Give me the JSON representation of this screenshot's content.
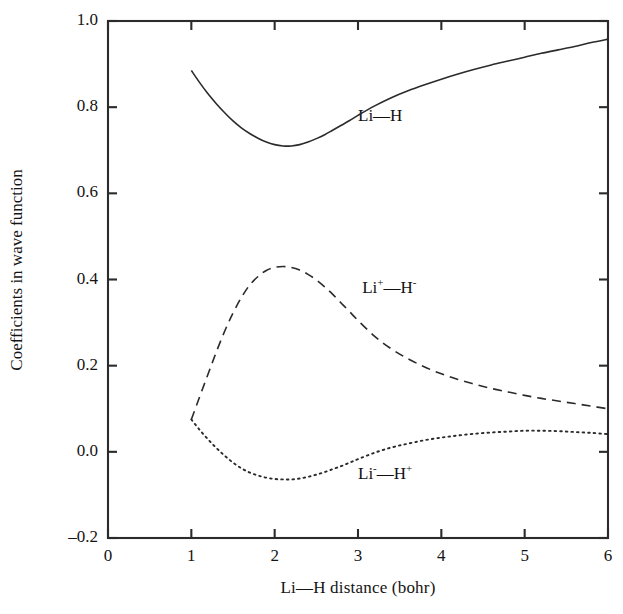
{
  "chart_data": {
    "type": "line",
    "title": "",
    "xlabel": "Li—H distance (bohr)",
    "ylabel": "Coefficients in wave function",
    "xlim": [
      0,
      6
    ],
    "ylim": [
      -0.2,
      1.0
    ],
    "xticks": [
      "0",
      "1",
      "2",
      "3",
      "4",
      "5",
      "6"
    ],
    "xtick_values": [
      0,
      1,
      2,
      3,
      4,
      5,
      6
    ],
    "yticks": [
      "-0.2",
      "0.0",
      "0.2",
      "0.4",
      "0.6",
      "0.8",
      "1.0"
    ],
    "ytick_values": [
      -0.2,
      0.0,
      0.2,
      0.4,
      0.6,
      0.8,
      1.0
    ],
    "grid": false,
    "legend_position": "inline-annotations",
    "series": [
      {
        "name": "Li—H",
        "label_html": "Li—H",
        "style": "solid",
        "color": "#2b2b2b",
        "annotation_x": 3.0,
        "annotation_y": 0.775,
        "x": [
          1.0,
          1.1,
          1.2,
          1.3,
          1.4,
          1.5,
          1.6,
          1.7,
          1.8,
          1.9,
          2.0,
          2.1,
          2.2,
          2.3,
          2.4,
          2.5,
          2.6,
          2.7,
          2.8,
          2.9,
          3.0,
          3.2,
          3.4,
          3.6,
          3.8,
          4.0,
          4.2,
          4.4,
          4.6,
          4.8,
          5.0,
          5.2,
          5.4,
          5.6,
          5.8,
          6.0
        ],
        "y": [
          0.885,
          0.857,
          0.831,
          0.808,
          0.787,
          0.768,
          0.752,
          0.739,
          0.728,
          0.719,
          0.713,
          0.71,
          0.71,
          0.713,
          0.719,
          0.727,
          0.736,
          0.747,
          0.758,
          0.769,
          0.781,
          0.803,
          0.822,
          0.838,
          0.852,
          0.865,
          0.877,
          0.888,
          0.898,
          0.907,
          0.916,
          0.925,
          0.933,
          0.941,
          0.95,
          0.958
        ]
      },
      {
        "name": "Li+—H-",
        "label_html": "Li<sup>+</sup>—H<sup>-</sup>",
        "style": "dashed",
        "color": "#2b2b2b",
        "annotation_x": 3.05,
        "annotation_y": 0.375,
        "x": [
          1.0,
          1.1,
          1.2,
          1.3,
          1.4,
          1.5,
          1.6,
          1.7,
          1.8,
          1.9,
          2.0,
          2.1,
          2.2,
          2.3,
          2.4,
          2.5,
          2.6,
          2.7,
          2.8,
          2.9,
          3.0,
          3.2,
          3.4,
          3.6,
          3.8,
          4.0,
          4.2,
          4.4,
          4.6,
          4.8,
          5.0,
          5.2,
          5.4,
          5.6,
          5.8,
          6.0
        ],
        "y": [
          0.075,
          0.128,
          0.18,
          0.232,
          0.28,
          0.322,
          0.358,
          0.387,
          0.407,
          0.421,
          0.428,
          0.43,
          0.428,
          0.422,
          0.412,
          0.399,
          0.383,
          0.365,
          0.345,
          0.325,
          0.305,
          0.268,
          0.239,
          0.216,
          0.197,
          0.181,
          0.168,
          0.157,
          0.147,
          0.139,
          0.131,
          0.124,
          0.118,
          0.112,
          0.106,
          0.1
        ]
      },
      {
        "name": "Li-—H+",
        "label_html": "Li<sup>-</sup>—H<sup>+</sup>",
        "style": "dotted",
        "color": "#2b2b2b",
        "annotation_x": 3.0,
        "annotation_y": -0.055,
        "x": [
          1.0,
          1.1,
          1.2,
          1.3,
          1.4,
          1.5,
          1.6,
          1.7,
          1.8,
          1.9,
          2.0,
          2.1,
          2.2,
          2.3,
          2.4,
          2.5,
          2.6,
          2.7,
          2.8,
          2.9,
          3.0,
          3.2,
          3.4,
          3.6,
          3.8,
          4.0,
          4.2,
          4.4,
          4.6,
          4.8,
          5.0,
          5.2,
          5.4,
          5.6,
          5.8,
          6.0
        ],
        "y": [
          0.075,
          0.051,
          0.029,
          0.009,
          -0.009,
          -0.025,
          -0.038,
          -0.048,
          -0.055,
          -0.06,
          -0.063,
          -0.064,
          -0.064,
          -0.062,
          -0.058,
          -0.053,
          -0.047,
          -0.04,
          -0.033,
          -0.025,
          -0.017,
          -0.002,
          0.01,
          0.019,
          0.027,
          0.033,
          0.038,
          0.042,
          0.045,
          0.047,
          0.049,
          0.049,
          0.048,
          0.046,
          0.044,
          0.041
        ]
      }
    ]
  },
  "axes": {
    "frame_color": "#2b2b2b"
  }
}
